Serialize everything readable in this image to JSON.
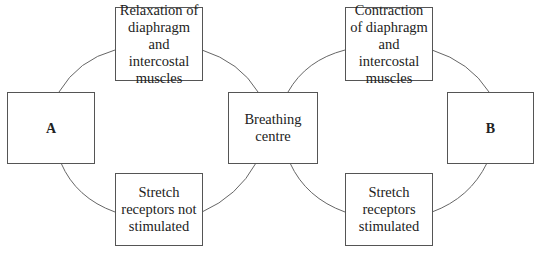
{
  "diagram": {
    "type": "cycle",
    "nodes": [
      {
        "id": "a",
        "label": "A"
      },
      {
        "id": "relax",
        "label": "Relaxation of diaphragm and intercostal muscles"
      },
      {
        "id": "centre",
        "label": "Breathing centre"
      },
      {
        "id": "stretch_not",
        "label": "Stretch receptors not stimulated"
      },
      {
        "id": "contract",
        "label": "Contraction of diaphragm and intercostal muscles"
      },
      {
        "id": "b",
        "label": "B"
      },
      {
        "id": "stretch",
        "label": "Stretch receptors stimulated"
      }
    ],
    "edges": [
      [
        "a",
        "relax"
      ],
      [
        "relax",
        "centre"
      ],
      [
        "centre",
        "stretch_not"
      ],
      [
        "stretch_not",
        "a"
      ],
      [
        "centre",
        "contract"
      ],
      [
        "contract",
        "b"
      ],
      [
        "b",
        "stretch"
      ],
      [
        "stretch",
        "centre"
      ]
    ]
  }
}
